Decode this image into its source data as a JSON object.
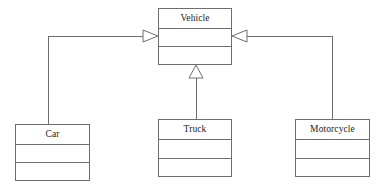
{
  "diagram": {
    "kind": "uml-class-diagram",
    "canvas": {
      "width": 381,
      "height": 187,
      "background": "#ffffff"
    },
    "style": {
      "line_color": "#6e6e72",
      "text_color": "#1b1b1d",
      "fill_color": "#ffffff",
      "stroke_width": 1
    },
    "classes": [
      {
        "id": "vehicle",
        "name": "Vehicle",
        "role": "superclass",
        "x": 158,
        "y": 8,
        "width": 74,
        "height": 57,
        "compartments": {
          "name_height": 20,
          "attributes_height": 18,
          "operations_height": 19
        },
        "attributes": [],
        "operations": []
      },
      {
        "id": "car",
        "name": "Car",
        "role": "subclass",
        "x": 15,
        "y": 124,
        "width": 75,
        "height": 57,
        "compartments": {
          "name_height": 20,
          "attributes_height": 18,
          "operations_height": 19
        },
        "attributes": [],
        "operations": []
      },
      {
        "id": "truck",
        "name": "Truck",
        "role": "subclass",
        "x": 158,
        "y": 119,
        "width": 74,
        "height": 58,
        "compartments": {
          "name_height": 20,
          "attributes_height": 19,
          "operations_height": 19
        },
        "attributes": [],
        "operations": []
      },
      {
        "id": "motorcycle",
        "name": "Motorcycle",
        "role": "subclass",
        "x": 295,
        "y": 119,
        "width": 75,
        "height": 58,
        "compartments": {
          "name_height": 20,
          "attributes_height": 19,
          "operations_height": 19
        },
        "attributes": [],
        "operations": []
      }
    ],
    "relationships": [
      {
        "id": "car-to-vehicle",
        "type": "generalization",
        "source": "car",
        "target": "vehicle",
        "arrow": "hollow-triangle",
        "arrow_direction": "right",
        "path": "M 48 124 L 48 36 L 143 36",
        "arrow_points": "143,30 158,36 143,42"
      },
      {
        "id": "truck-to-vehicle",
        "type": "generalization",
        "source": "truck",
        "target": "vehicle",
        "arrow": "hollow-triangle",
        "arrow_direction": "up",
        "path": "M 196 119 L 196 78",
        "arrow_points": "189,78 196,65 203,78"
      },
      {
        "id": "motorcycle-to-vehicle",
        "type": "generalization",
        "source": "motorcycle",
        "target": "vehicle",
        "arrow": "hollow-triangle",
        "arrow_direction": "left",
        "path": "M 332 119 L 332 36 L 247 36",
        "arrow_points": "247,30 232,36 247,42"
      }
    ]
  }
}
